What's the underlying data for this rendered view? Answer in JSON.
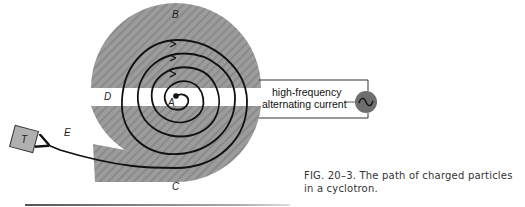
{
  "figure": {
    "labels": {
      "B": "B",
      "D": "D",
      "A": "A",
      "C": "C",
      "E": "E",
      "T": "T"
    },
    "circuit_label_line1": "high-frequency",
    "circuit_label_line2": "alternating current",
    "source_symbol": "~",
    "caption_line1": "FIG. 20–3. The path of charged particles",
    "caption_line2": "in a cyclotron.",
    "colors": {
      "dee": "#9a9a9a",
      "path": "#111111",
      "source": "#6e6e6e",
      "target": "#b0b0b0"
    }
  }
}
